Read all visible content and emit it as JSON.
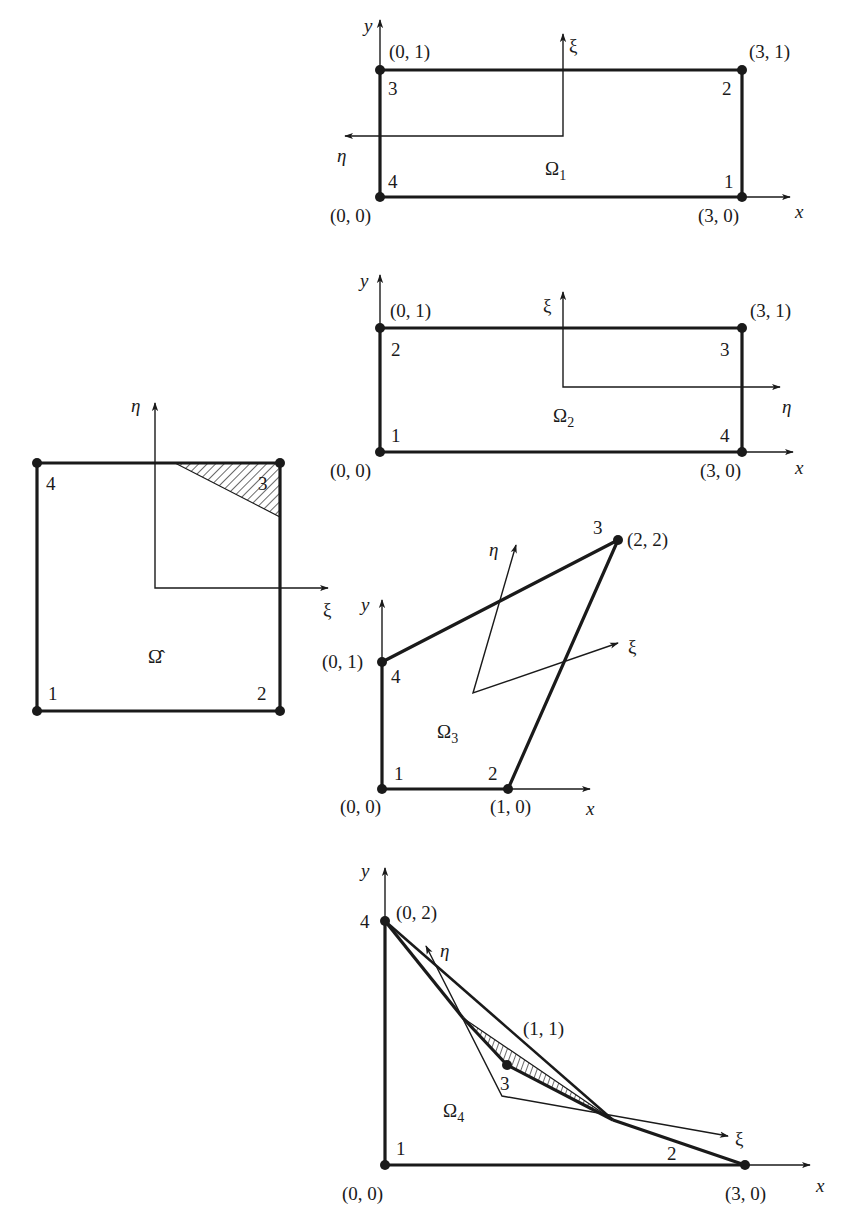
{
  "figure": {
    "reference_element": {
      "label": "Ω̂",
      "axes": {
        "horizontal": "ξ",
        "vertical": "η"
      },
      "nodes": [
        "1",
        "2",
        "3",
        "4"
      ]
    },
    "elements": [
      {
        "id": "omega1",
        "label": "Ω",
        "subscript": "1",
        "axes": {
          "x": "x",
          "y": "y",
          "xi": "ξ",
          "eta": "η"
        },
        "nodes": [
          {
            "num": "1",
            "coord": "(3, 0)"
          },
          {
            "num": "2",
            "coord": "(3, 1)"
          },
          {
            "num": "3",
            "coord": "(0, 1)"
          },
          {
            "num": "4",
            "coord": "(0, 0)"
          }
        ]
      },
      {
        "id": "omega2",
        "label": "Ω",
        "subscript": "2",
        "axes": {
          "x": "x",
          "y": "y",
          "xi": "ξ",
          "eta": "η"
        },
        "nodes": [
          {
            "num": "1",
            "coord": "(0, 0)"
          },
          {
            "num": "2",
            "coord": "(0, 1)"
          },
          {
            "num": "3",
            "coord": "(3, 1)"
          },
          {
            "num": "4",
            "coord": "(3, 0)"
          }
        ]
      },
      {
        "id": "omega3",
        "label": "Ω",
        "subscript": "3",
        "axes": {
          "x": "x",
          "y": "y",
          "xi": "ξ",
          "eta": "η"
        },
        "nodes": [
          {
            "num": "1",
            "coord": "(0, 0)"
          },
          {
            "num": "2",
            "coord": "(1, 0)"
          },
          {
            "num": "3",
            "coord": "(2, 2)"
          },
          {
            "num": "4",
            "coord": "(0, 1)"
          }
        ]
      },
      {
        "id": "omega4",
        "label": "Ω",
        "subscript": "4",
        "axes": {
          "x": "x",
          "y": "y",
          "xi": "ξ",
          "eta": "η"
        },
        "nodes": [
          {
            "num": "1",
            "coord": "(0, 0)"
          },
          {
            "num": "2",
            "coord": "(3, 0)"
          },
          {
            "num": "3",
            "coord": "(1, 1)"
          },
          {
            "num": "4",
            "coord": "(0, 2)"
          }
        ]
      }
    ]
  }
}
